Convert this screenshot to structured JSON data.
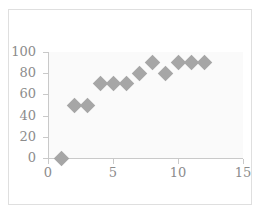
{
  "chart_data": {
    "type": "scatter",
    "title": "",
    "xlabel": "",
    "ylabel": "",
    "x": [
      1,
      2,
      3,
      4,
      5,
      6,
      7,
      8,
      9,
      10,
      11,
      12
    ],
    "values": [
      0,
      50,
      50,
      70,
      70,
      70,
      80,
      90,
      80,
      90,
      90,
      90
    ],
    "points": [
      {
        "x": 1,
        "y": 0
      },
      {
        "x": 2,
        "y": 50
      },
      {
        "x": 3,
        "y": 50
      },
      {
        "x": 4,
        "y": 70
      },
      {
        "x": 5,
        "y": 70
      },
      {
        "x": 6,
        "y": 70
      },
      {
        "x": 7,
        "y": 80
      },
      {
        "x": 8,
        "y": 90
      },
      {
        "x": 9,
        "y": 80
      },
      {
        "x": 10,
        "y": 90
      },
      {
        "x": 11,
        "y": 90
      },
      {
        "x": 12,
        "y": 90
      }
    ],
    "xlim": [
      0,
      15
    ],
    "ylim": [
      0,
      100
    ],
    "xticks": [
      "0",
      "5",
      "10",
      "15"
    ],
    "xtick_values": [
      0,
      5,
      10,
      15
    ],
    "yticks": [
      "0",
      "20",
      "40",
      "60",
      "80",
      "100"
    ],
    "ytick_values": [
      0,
      20,
      40,
      60,
      80,
      100
    ],
    "grid": false,
    "legend": false,
    "marker": "diamond",
    "marker_color": "#a6a6a6",
    "plot_background": "#fafafa",
    "axis_color": "#c9c9c9",
    "tick_label_color": "#8c8c8c",
    "frame_color": "#dfdfdf"
  }
}
